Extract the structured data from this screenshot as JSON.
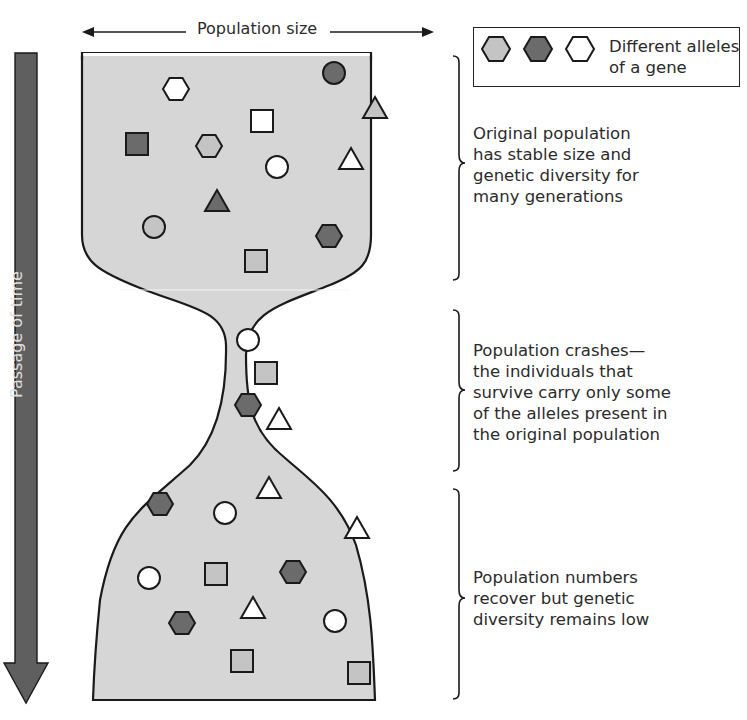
{
  "title_axis": {
    "population_size": "Population size"
  },
  "time_axis": {
    "label": "Passage of time"
  },
  "legend": {
    "text_line1": "Different alleles",
    "text_line2": "of a gene",
    "alleles": [
      {
        "name": "allele-light",
        "color": "#c4c4c4"
      },
      {
        "name": "allele-dark",
        "color": "#6b6b6b"
      },
      {
        "name": "allele-white",
        "color": "#ffffff"
      }
    ]
  },
  "stages": [
    {
      "name": "original",
      "lines": [
        "Original population",
        "has stable size and",
        "genetic diversity for",
        "many generations"
      ]
    },
    {
      "name": "bottleneck",
      "lines": [
        "Population crashes—",
        "the individuals that",
        "survive carry only some",
        "of the alleles present in",
        "the original population"
      ]
    },
    {
      "name": "recovery",
      "lines": [
        "Population numbers",
        "recover but genetic",
        "diversity remains low"
      ]
    }
  ],
  "colors": {
    "population_fill": "#d6d6d6",
    "outline": "#1a1a1a",
    "arrow_fill": "#5f5f5f",
    "light": "#c4c4c4",
    "dark": "#6b6b6b",
    "white": "#ffffff"
  },
  "individuals": [
    {
      "stage": "original",
      "shape": "hexagon",
      "allele": "white"
    },
    {
      "stage": "original",
      "shape": "circle",
      "allele": "dark"
    },
    {
      "stage": "original",
      "shape": "triangle",
      "allele": "light"
    },
    {
      "stage": "original",
      "shape": "square",
      "allele": "white"
    },
    {
      "stage": "original",
      "shape": "square",
      "allele": "dark"
    },
    {
      "stage": "original",
      "shape": "hexagon",
      "allele": "light"
    },
    {
      "stage": "original",
      "shape": "circle",
      "allele": "white"
    },
    {
      "stage": "original",
      "shape": "triangle",
      "allele": "white"
    },
    {
      "stage": "original",
      "shape": "triangle",
      "allele": "dark"
    },
    {
      "stage": "original",
      "shape": "circle",
      "allele": "light"
    },
    {
      "stage": "original",
      "shape": "hexagon",
      "allele": "dark"
    },
    {
      "stage": "original",
      "shape": "square",
      "allele": "light"
    },
    {
      "stage": "bottleneck",
      "shape": "circle",
      "allele": "white"
    },
    {
      "stage": "bottleneck",
      "shape": "square",
      "allele": "light"
    },
    {
      "stage": "bottleneck",
      "shape": "hexagon",
      "allele": "dark"
    },
    {
      "stage": "bottleneck",
      "shape": "triangle",
      "allele": "white"
    },
    {
      "stage": "recovery",
      "shape": "triangle",
      "allele": "white"
    },
    {
      "stage": "recovery",
      "shape": "hexagon",
      "allele": "dark"
    },
    {
      "stage": "recovery",
      "shape": "circle",
      "allele": "white"
    },
    {
      "stage": "recovery",
      "shape": "triangle",
      "allele": "white"
    },
    {
      "stage": "recovery",
      "shape": "circle",
      "allele": "white"
    },
    {
      "stage": "recovery",
      "shape": "square",
      "allele": "light"
    },
    {
      "stage": "recovery",
      "shape": "hexagon",
      "allele": "dark"
    },
    {
      "stage": "recovery",
      "shape": "triangle",
      "allele": "white"
    },
    {
      "stage": "recovery",
      "shape": "hexagon",
      "allele": "dark"
    },
    {
      "stage": "recovery",
      "shape": "circle",
      "allele": "white"
    },
    {
      "stage": "recovery",
      "shape": "square",
      "allele": "light"
    },
    {
      "stage": "recovery",
      "shape": "square",
      "allele": "light"
    }
  ]
}
